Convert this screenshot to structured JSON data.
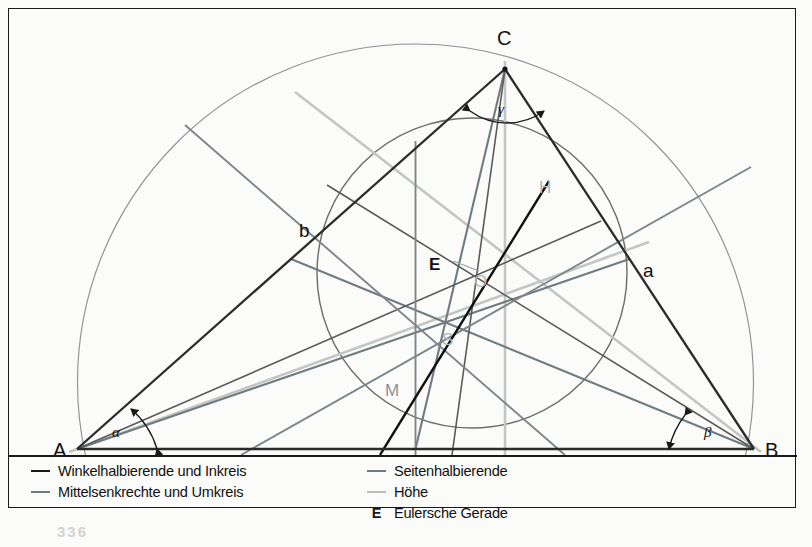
{
  "figure": {
    "vertices": [
      {
        "name": "A",
        "label": "A",
        "x": 68,
        "y": 440
      },
      {
        "name": "B",
        "label": "B",
        "x": 745,
        "y": 440
      },
      {
        "name": "C",
        "label": "C",
        "x": 496,
        "y": 60
      }
    ],
    "side_labels": [
      {
        "name": "side-a",
        "label": "a",
        "x": 640,
        "y": 262
      },
      {
        "name": "side-b",
        "label": "b",
        "x": 296,
        "y": 222
      },
      {
        "name": "side-c",
        "label": "c",
        "x": 428,
        "y": 456
      }
    ],
    "angle_labels": [
      {
        "name": "angle-alpha",
        "label": "α",
        "x": 108,
        "y": 424
      },
      {
        "name": "angle-beta",
        "label": "β",
        "x": 700,
        "y": 424
      },
      {
        "name": "angle-gamma",
        "label": "γ",
        "x": 492,
        "y": 100
      }
    ],
    "points": [
      {
        "name": "orthocenter",
        "label": "H",
        "x": 536,
        "y": 178,
        "color": "#b2b6b5"
      },
      {
        "name": "incenter",
        "label": "O",
        "x": 471,
        "y": 272,
        "color": "#b2b6b5"
      },
      {
        "name": "centroid",
        "label": "S",
        "x": 439,
        "y": 330,
        "color": "#b2b6b5"
      },
      {
        "name": "circumcenter",
        "label": "M",
        "x": 384,
        "y": 381,
        "color": "#8b9299"
      },
      {
        "name": "euler-line",
        "label": "E",
        "x": 428,
        "y": 255,
        "color": "#111111"
      }
    ]
  },
  "legend": {
    "left": [
      {
        "name": "legend-bisector-incircle",
        "label": "Winkelhalbierende und Inkreis",
        "swatch": "dark"
      },
      {
        "name": "legend-perpbisector-circumcircle",
        "label": "Mittelsenkrechte und Umkreis",
        "swatch": "mid"
      }
    ],
    "right": [
      {
        "name": "legend-median",
        "label": "Seitenhalbierende",
        "swatch": "mid"
      },
      {
        "name": "legend-altitude",
        "label": "Höhe",
        "swatch": "light"
      },
      {
        "name": "legend-euler-line",
        "label": "Eulersche Gerade",
        "swatch": "E"
      }
    ]
  },
  "page": {
    "number": "336"
  },
  "colors": {
    "ink": "#1a1a1a",
    "triangle": "#2b2b2b",
    "median": "#6f7b82",
    "altitude": "#c2c6c5",
    "bisector": "#5a5a5a",
    "perp_bisector": "#7d868c",
    "incircle": "#6e6e6e",
    "circumcircle": "#8d9499",
    "euler": "#111111",
    "background": "#fbfbf9"
  }
}
